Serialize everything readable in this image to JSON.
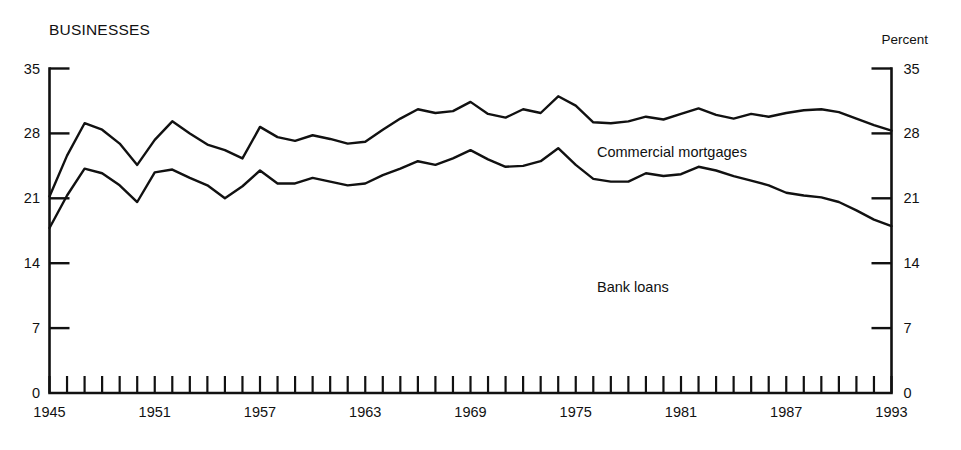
{
  "panel": {
    "title": "BUSINESSES",
    "unit_label": "Percent"
  },
  "labels": {
    "commercial_mortgages": "Commercial mortgages",
    "bank_loans": "Bank loans"
  },
  "axes": {
    "y_left_ticks": [
      "0",
      "7",
      "14",
      "21",
      "28",
      "35"
    ],
    "y_right_ticks": [
      "0",
      "7",
      "14",
      "21",
      "28",
      "35"
    ],
    "x_ticks": [
      "1945",
      "1951",
      "1957",
      "1963",
      "1969",
      "1975",
      "1981",
      "1987",
      "1993"
    ]
  },
  "colors": {
    "ink": "#111111",
    "background": "#ffffff"
  },
  "chart_data": {
    "type": "line",
    "title": "BUSINESSES",
    "xlabel": "",
    "ylabel": "Percent",
    "xlim": [
      1945,
      1993
    ],
    "ylim": [
      0,
      35
    ],
    "yticks": [
      0,
      7,
      14,
      21,
      28,
      35
    ],
    "xticks": [
      1945,
      1951,
      1957,
      1963,
      1969,
      1975,
      1981,
      1987,
      1993
    ],
    "grid": false,
    "legend": "inline-annotations",
    "x": [
      1945,
      1946,
      1947,
      1948,
      1949,
      1950,
      1951,
      1952,
      1953,
      1954,
      1955,
      1956,
      1957,
      1958,
      1959,
      1960,
      1961,
      1962,
      1963,
      1964,
      1965,
      1966,
      1967,
      1968,
      1969,
      1970,
      1971,
      1972,
      1973,
      1974,
      1975,
      1976,
      1977,
      1978,
      1979,
      1980,
      1981,
      1982,
      1983,
      1984,
      1985,
      1986,
      1987,
      1988,
      1989,
      1990,
      1991,
      1992,
      1993
    ],
    "series": [
      {
        "name": "Commercial mortgages",
        "values": [
          21.2,
          25.6,
          29.1,
          28.4,
          26.9,
          24.6,
          27.3,
          29.3,
          28.0,
          26.8,
          26.2,
          25.3,
          28.7,
          27.6,
          27.2,
          27.8,
          27.4,
          26.9,
          27.1,
          28.4,
          29.6,
          30.6,
          30.2,
          30.4,
          31.4,
          30.1,
          29.7,
          30.6,
          30.2,
          32.0,
          31.0,
          29.2,
          29.1,
          29.3,
          29.8,
          29.5,
          30.1,
          30.7,
          30.0,
          29.6,
          30.1,
          29.8,
          30.2,
          30.5,
          30.6,
          30.3,
          29.6,
          28.9,
          28.3
        ]
      },
      {
        "name": "Bank loans",
        "values": [
          17.8,
          21.3,
          24.2,
          23.7,
          22.4,
          20.6,
          23.8,
          24.1,
          23.2,
          22.4,
          21.0,
          22.3,
          24.0,
          22.6,
          22.6,
          23.2,
          22.8,
          22.4,
          22.6,
          23.5,
          24.2,
          25.0,
          24.6,
          25.3,
          26.2,
          25.2,
          24.4,
          24.5,
          25.0,
          26.4,
          24.6,
          23.1,
          22.8,
          22.8,
          23.7,
          23.4,
          23.6,
          24.4,
          24.0,
          23.4,
          22.9,
          22.4,
          21.6,
          21.3,
          21.1,
          20.6,
          19.7,
          18.7,
          18.0
        ]
      }
    ]
  }
}
